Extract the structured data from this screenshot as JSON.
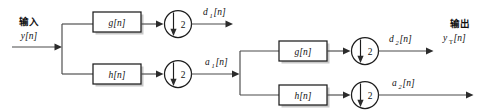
{
  "diagram": {
    "colors": {
      "wire": "#4a4a4a",
      "outline": "#1d1d1d",
      "block_fill": "#ffffff",
      "shadow": "#9a9a9a",
      "text": "#111111"
    },
    "input": {
      "cjk_label": "输入",
      "signal_label": "y[n]",
      "name": "input-signal"
    },
    "output": {
      "cjk_label": "输出",
      "signal_base": "y",
      "signal_sub": "T",
      "signal_tail": "[n]",
      "name": "output-signal"
    },
    "stage1": {
      "highpass_block": "g[n]",
      "lowpass_block": "h[n]",
      "downsample_factor": "2",
      "detail_base": "d",
      "detail_sub": "1",
      "detail_tail": "[n]",
      "approx_base": "a",
      "approx_sub": "1",
      "approx_tail": "[n]"
    },
    "stage2": {
      "highpass_block": "g[n]",
      "lowpass_block": "h[n]",
      "downsample_factor": "2",
      "detail_base": "d",
      "detail_sub": "2",
      "detail_tail": "[n]",
      "approx_base": "a",
      "approx_sub": "2",
      "approx_tail": "[n]"
    }
  }
}
